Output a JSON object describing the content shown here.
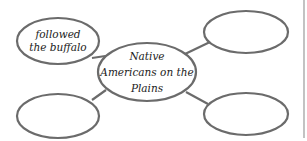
{
  "diagram": {
    "type": "concept-web",
    "center": {
      "text_lines": [
        "Native",
        "Americans on the",
        "Plains"
      ]
    },
    "nodes": [
      {
        "id": "top-left",
        "text_lines": [
          "followed",
          "the buffalo"
        ]
      },
      {
        "id": "top-right",
        "text_lines": []
      },
      {
        "id": "bottom-left",
        "text_lines": []
      },
      {
        "id": "bottom-right",
        "text_lines": []
      }
    ],
    "colors": {
      "outline": "#6b6b6b",
      "text": "#222222",
      "background": "#ffffff"
    }
  }
}
